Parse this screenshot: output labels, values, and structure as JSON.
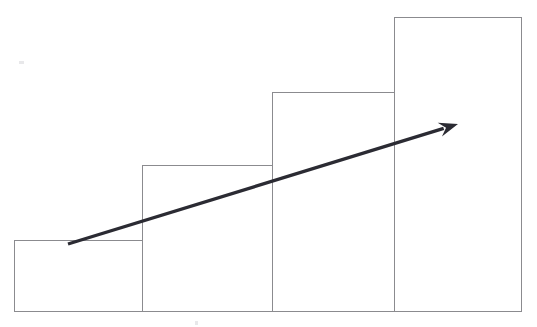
{
  "chart_data": {
    "type": "bar",
    "title": "",
    "subtitle": "",
    "xlabel": "",
    "ylabel": "",
    "categories": [
      "1",
      "2",
      "3",
      "4"
    ],
    "values": [
      71,
      146,
      219,
      294
    ],
    "ylim": [
      0,
      311
    ],
    "xlim": [
      0,
      537
    ],
    "grid": false,
    "legend": null,
    "annotations": [
      {
        "name": "growth-trend-arrow",
        "type": "arrow",
        "from": [
          68,
          244
        ],
        "to": [
          458,
          124
        ],
        "label": ""
      }
    ],
    "series": [
      {
        "name": "bars",
        "values": [
          71,
          146,
          219,
          294
        ]
      }
    ],
    "bar_geometry": [
      {
        "index": 0,
        "x": 14,
        "width": 128,
        "top": 240,
        "height": 71
      },
      {
        "index": 1,
        "x": 142,
        "width": 130,
        "top": 165,
        "height": 146
      },
      {
        "index": 2,
        "x": 272,
        "width": 122,
        "top": 92,
        "height": 219
      },
      {
        "index": 3,
        "x": 394,
        "width": 127,
        "top": 17,
        "height": 294
      }
    ],
    "baseline_y": 311
  },
  "style": {
    "background": "#ffffff",
    "bar_stroke": "#8b8b8f",
    "bar_fill": "#ffffff",
    "bar_stroke_width": "1",
    "arrow_color": "#2b2b33",
    "arrow_stroke_width": "3.4",
    "speck_color": "#e8e8ea"
  },
  "figure": {
    "name": "ascending-bar-chart-with-growth-arrow"
  },
  "artifacts": [
    {
      "name": "scan-speck-top-left",
      "x": 19,
      "y": 61,
      "w": 5,
      "h": 3
    },
    {
      "name": "scan-speck-bottom",
      "x": 195,
      "y": 321,
      "w": 3,
      "h": 4
    }
  ]
}
